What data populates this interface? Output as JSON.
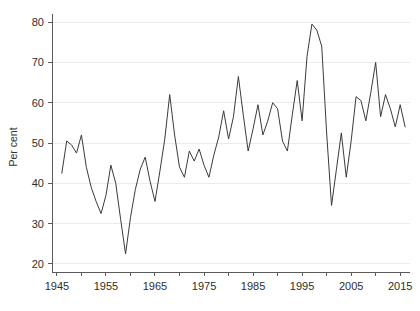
{
  "chart_data": {
    "type": "line",
    "title": "",
    "subtitle": "",
    "xlabel": "",
    "ylabel": "Per cent",
    "xlim": [
      1944,
      2017
    ],
    "ylim": [
      18,
      82
    ],
    "grid": "horizontal",
    "legend": "none",
    "x_ticks": [
      1945,
      1955,
      1965,
      1975,
      1985,
      1995,
      2005,
      2015
    ],
    "x_tick_labels": [
      "1945",
      "1955",
      "1965",
      "1975",
      "1985",
      "1995",
      "2005",
      "2015"
    ],
    "x_minor_ticks": [
      1950,
      1960,
      1970,
      1980,
      1990,
      2000,
      2010
    ],
    "y_ticks": [
      20,
      30,
      40,
      50,
      60,
      70,
      80
    ],
    "y_tick_labels": [
      "20",
      "30",
      "40",
      "50",
      "60",
      "70",
      "80"
    ],
    "series": [
      {
        "name": "Per cent",
        "color": "#3b3b3b",
        "x": [
          1946,
          1947,
          1948,
          1949,
          1950,
          1951,
          1952,
          1953,
          1954,
          1955,
          1956,
          1957,
          1958,
          1959,
          1960,
          1961,
          1962,
          1963,
          1964,
          1965,
          1966,
          1967,
          1968,
          1969,
          1970,
          1971,
          1972,
          1973,
          1974,
          1975,
          1976,
          1977,
          1978,
          1979,
          1980,
          1981,
          1982,
          1983,
          1984,
          1985,
          1986,
          1987,
          1988,
          1989,
          1990,
          1991,
          1992,
          1993,
          1994,
          1995,
          1996,
          1997,
          1998,
          1999,
          2000,
          2001,
          2002,
          2003,
          2004,
          2005,
          2006,
          2007,
          2008,
          2009,
          2010,
          2011,
          2012,
          2013,
          2014,
          2015,
          2016
        ],
        "values": [
          42.5,
          50.5,
          49.5,
          47.5,
          52.0,
          44.0,
          39.0,
          35.5,
          32.5,
          37.0,
          44.5,
          40.0,
          31.0,
          22.5,
          31.5,
          38.5,
          43.5,
          46.5,
          40.5,
          35.5,
          43.0,
          51.0,
          62.0,
          52.0,
          44.0,
          41.5,
          48.0,
          45.5,
          48.5,
          44.5,
          41.5,
          47.0,
          51.5,
          58.0,
          51.0,
          56.5,
          66.5,
          57.0,
          48.0,
          53.5,
          59.5,
          52.0,
          55.5,
          60.0,
          58.5,
          50.5,
          48.0,
          57.0,
          65.5,
          55.5,
          71.5,
          79.5,
          78.0,
          74.0,
          52.5,
          34.5,
          43.5,
          52.5,
          41.5,
          50.5,
          61.5,
          60.5,
          55.5,
          62.5,
          70.0,
          56.5,
          62.0,
          58.5,
          54.0,
          59.5,
          54.0
        ]
      }
    ]
  },
  "axis": {
    "y_title": "Per cent"
  }
}
